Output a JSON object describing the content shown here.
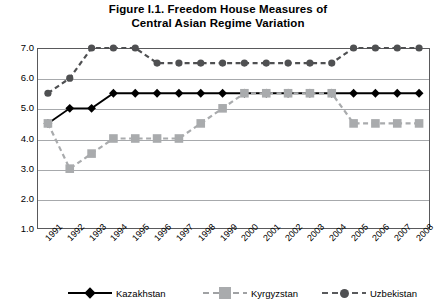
{
  "chart_data": {
    "type": "line",
    "title": "Figure I.1. Freedom House Measures of Central Asian Regime Variation",
    "title_line1": "Figure I.1. Freedom House Measures of",
    "title_line2": "Central Asian Regime Variation",
    "xlabel": "",
    "ylabel": "",
    "x": [
      1991,
      1992,
      1993,
      1994,
      1995,
      1996,
      1997,
      1998,
      1999,
      2000,
      2001,
      2002,
      2003,
      2004,
      2005,
      2006,
      2007,
      2008
    ],
    "categories": [
      "1991",
      "1992",
      "1993",
      "1994",
      "1995",
      "1996",
      "1997",
      "1998",
      "1999",
      "2000",
      "2001",
      "2002",
      "2003",
      "2004",
      "2005",
      "2006",
      "2007",
      "2008"
    ],
    "ylim": [
      1.0,
      7.0
    ],
    "yticks": [
      7.0,
      6.0,
      5.0,
      4.0,
      3.0,
      2.0,
      1.0
    ],
    "ytick_labels": [
      "7.0",
      "6.0",
      "5.0",
      "4.0",
      "3.0",
      "2.0",
      "1.0"
    ],
    "grid": true,
    "legend_position": "bottom",
    "series": [
      {
        "name": "Kazakhstan",
        "marker": "diamond",
        "line_style": "solid",
        "color": "#000000",
        "values": [
          4.5,
          5.0,
          5.0,
          5.5,
          5.5,
          5.5,
          5.5,
          5.5,
          5.5,
          5.5,
          5.5,
          5.5,
          5.5,
          5.5,
          5.5,
          5.5,
          5.5,
          5.5
        ]
      },
      {
        "name": "Kyrgyzstan",
        "marker": "square",
        "line_style": "dashed",
        "color": "#a9abad",
        "values": [
          4.5,
          3.0,
          3.5,
          4.0,
          4.0,
          4.0,
          4.0,
          4.5,
          5.0,
          5.5,
          5.5,
          5.5,
          5.5,
          5.5,
          4.5,
          4.5,
          4.5,
          4.5
        ]
      },
      {
        "name": "Uzbekistan",
        "marker": "circle",
        "line_style": "dashed",
        "color": "#4f5052",
        "values": [
          5.5,
          6.0,
          7.0,
          7.0,
          7.0,
          6.5,
          6.5,
          6.5,
          6.5,
          6.5,
          6.5,
          6.5,
          6.5,
          6.5,
          7.0,
          7.0,
          7.0,
          7.0
        ]
      }
    ]
  },
  "colors": {
    "kazakhstan": "#000000",
    "kyrgyzstan": "#a9abad",
    "uzbekistan": "#4f5052",
    "gridline": "#a7a9ac",
    "frame": "#59595b",
    "background": "#ffffff"
  }
}
